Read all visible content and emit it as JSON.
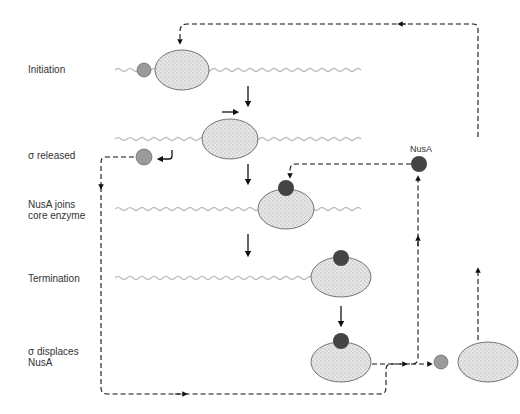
{
  "diagram": {
    "stages": [
      {
        "label_line1": "Initiation",
        "label_line2": ""
      },
      {
        "label_line1": "σ released",
        "label_line2": ""
      },
      {
        "label_line1": "NusA joins",
        "label_line2": "core enzyme"
      },
      {
        "label_line1": "Termination",
        "label_line2": ""
      },
      {
        "label_line1": "σ displaces",
        "label_line2": "NusA"
      }
    ],
    "nusa_label": "NusA",
    "colors": {
      "enzyme_fill": "#e4e4e4",
      "sigma_fill": "#9a9a9a",
      "nusa_fill": "#444444",
      "dna": "#bdbdbd",
      "arrow": "#111111"
    }
  }
}
